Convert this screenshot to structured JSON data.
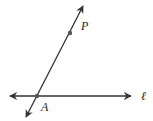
{
  "diagram": {
    "colors": {
      "line": "#333333",
      "point": "#555555",
      "background": "#ffffff"
    },
    "lines": [
      {
        "name": "line-l",
        "label": "ℓ",
        "x1": 10,
        "y1": 96,
        "x2": 131,
        "y2": 96
      },
      {
        "name": "line-AP",
        "label": "",
        "x1": 26,
        "y1": 117,
        "x2": 83,
        "y2": 6
      }
    ],
    "points": [
      {
        "name": "A",
        "label": "A",
        "x": 37,
        "y": 96
      },
      {
        "name": "P",
        "label": "P",
        "x": 70,
        "y": 33
      }
    ],
    "labels": {
      "A": "A",
      "P": "P",
      "l": "ℓ"
    }
  }
}
